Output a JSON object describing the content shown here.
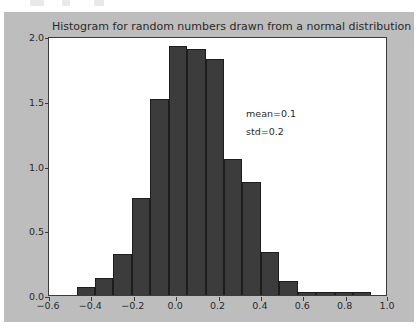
{
  "figure": {
    "background_color": "#bdbdbd",
    "axes_background_color": "#ffffff",
    "bar_color": "#3c3c3c",
    "bar_edge_color": "#1d1d1d"
  },
  "chart_data": {
    "type": "bar",
    "title": "Histogram for random numbers drawn from a normal distribution",
    "xlabel": "",
    "ylabel": "",
    "xlim": [
      -0.6,
      1.0
    ],
    "ylim": [
      0.0,
      2.0
    ],
    "grid": false,
    "legend": null,
    "xticks": [
      "-0.6",
      "-0.4",
      "-0.2",
      "0.0",
      "0.2",
      "0.4",
      "0.6",
      "0.8",
      "1.0"
    ],
    "xtick_values": [
      -0.6,
      -0.4,
      -0.2,
      0.0,
      0.2,
      0.4,
      0.6,
      0.8,
      1.0
    ],
    "yticks": [
      "0.0",
      "0.5",
      "1.0",
      "1.5",
      "2.0"
    ],
    "ytick_values": [
      0.0,
      0.5,
      1.0,
      1.5,
      2.0
    ],
    "bin_edges": [
      -0.47,
      -0.383,
      -0.296,
      -0.209,
      -0.122,
      -0.035,
      0.052,
      0.139,
      0.226,
      0.313,
      0.4,
      0.487,
      0.574,
      0.661,
      0.748,
      0.835,
      0.922
    ],
    "values": [
      0.06,
      0.13,
      0.32,
      0.75,
      1.51,
      1.92,
      1.9,
      1.82,
      1.05,
      0.87,
      0.33,
      0.11,
      0.02,
      0.02,
      0.02,
      0.02
    ],
    "annotations": [
      {
        "text": "mean=0.1",
        "x": 0.33,
        "y": 1.46
      },
      {
        "text": "std=0.2",
        "x": 0.33,
        "y": 1.32
      }
    ]
  }
}
